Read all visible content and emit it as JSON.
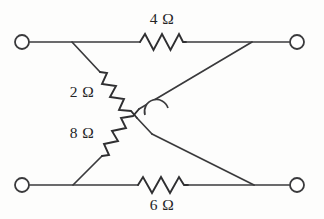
{
  "diagram": {
    "type": "electrical-circuit-schematic",
    "background_color": "#fdfdfc",
    "line_color": "#3a3a3c",
    "text_color": "#242426",
    "terminals": [
      {
        "name": "top-left-terminal",
        "x": 22,
        "y": 42
      },
      {
        "name": "top-right-terminal",
        "x": 297,
        "y": 42
      },
      {
        "name": "bottom-left-terminal",
        "x": 22,
        "y": 185
      },
      {
        "name": "bottom-right-terminal",
        "x": 297,
        "y": 185
      }
    ],
    "resistors": [
      {
        "id": "r-top",
        "label": "4 Ω",
        "value": 4,
        "unit": "Ω",
        "orientation": "horizontal",
        "label_position": "above",
        "label_x": 162,
        "label_y": 24
      },
      {
        "id": "r-upper-diagonal",
        "label": "2 Ω",
        "value": 2,
        "unit": "Ω",
        "orientation": "diagonal-down-right",
        "label_position": "left",
        "label_x": 82,
        "label_y": 97
      },
      {
        "id": "r-lower-diagonal",
        "label": "8 Ω",
        "value": 8,
        "unit": "Ω",
        "orientation": "diagonal-up-right",
        "label_position": "left",
        "label_x": 82,
        "label_y": 138
      },
      {
        "id": "r-bottom",
        "label": "6 Ω",
        "value": 6,
        "unit": "Ω",
        "orientation": "horizontal",
        "label_position": "below",
        "label_x": 162,
        "label_y": 209
      }
    ],
    "crossing": {
      "name": "wire-crossing-hop",
      "x": 160,
      "y": 110,
      "connected": false,
      "note": "semicircular hop — wires cross without connecting"
    },
    "paths": {
      "top_wire_left": "M 30 42 L 140 42",
      "top_wire_right": "M 186 42 L 289 42",
      "bottom_wire_left": "M 30 185 L 138 185",
      "bottom_wire_right": "M 188 185 L 289 185",
      "top_zigzag": "M 140 42 L 145 34 L 153.5 50 L 162 34 L 170.5 50 L 179 34 L 183 42 L 186 42",
      "bottom_zigzag": "M 138 185 L 143 177 L 152 193 L 161 177 L 170 193 L 179 177 L 184 185 L 188 185",
      "lead_2ohm_top": "M 72 42 L 100 72",
      "zigzag_2ohm": "M 100 72 L 107 73 L 102 84 L 116 86 L 110 97 L 124 99 L 119 110 L 131 111 L 137 118",
      "lead_2ohm_bottom": "M 137 118 L 152 134",
      "lead_8ohm_bottom": "M 73 185 L 102 156",
      "zigzag_8ohm": "M 102 156 L 109 155 L 104 144 L 118 141 L 112 131 L 126 128 L 121 118 L 133 116 L 139 109",
      "lead_8ohm_top": "M 139 109 L 252 42",
      "crossing_wire": "M 152 134 L 254 185"
    }
  }
}
